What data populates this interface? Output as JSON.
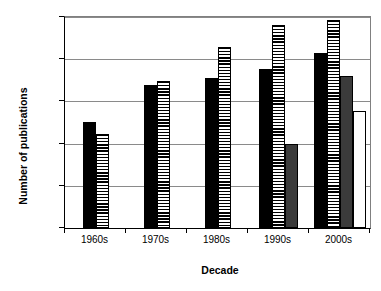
{
  "chart_data": {
    "type": "bar",
    "title": "",
    "xlabel": "Decade",
    "ylabel": "Number of publications",
    "yscale": "log",
    "ylim": [
      1,
      100000
    ],
    "grid": true,
    "legend": "none",
    "categories": [
      "1960s",
      "1970s",
      "1980s",
      "1990s",
      "2000s"
    ],
    "ytick_labels": [
      "100,000",
      "10,000",
      "1000",
      "100",
      "10",
      "1"
    ],
    "ytick_values": [
      100000,
      10000,
      1000,
      100,
      10,
      1
    ],
    "series": [
      {
        "name": "series-1",
        "style": "black",
        "values": [
          330,
          2400,
          3500,
          6000,
          14000
        ]
      },
      {
        "name": "series-2",
        "style": "horizontal-stripes",
        "values": [
          170,
          3000,
          20000,
          65000,
          85000
        ]
      },
      {
        "name": "series-3",
        "style": "dark-gray",
        "values": [
          null,
          null,
          null,
          100,
          4000
        ]
      },
      {
        "name": "series-4",
        "style": "white",
        "values": [
          null,
          null,
          null,
          null,
          600
        ]
      }
    ]
  }
}
